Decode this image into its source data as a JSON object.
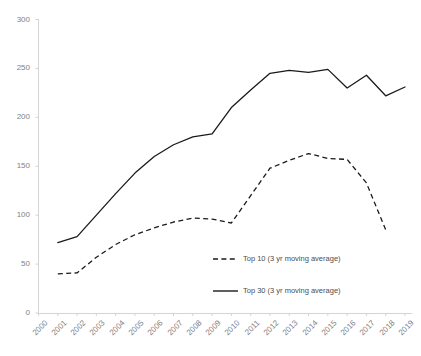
{
  "chart_data": {
    "type": "line",
    "title": "",
    "xlabel": "",
    "ylabel": "",
    "grid": false,
    "legend_position": "center-inside",
    "x": [
      2000,
      2001,
      2002,
      2003,
      2004,
      2005,
      2006,
      2007,
      2008,
      2009,
      2010,
      2011,
      2012,
      2013,
      2014,
      2015,
      2016,
      2017,
      2018,
      2019
    ],
    "xtick_labels": [
      "2000",
      "2001",
      "2002",
      "2003",
      "2004",
      "2005",
      "2006",
      "2007",
      "2008",
      "2009",
      "2010",
      "2011",
      "2012",
      "2013",
      "2014",
      "2015",
      "2016",
      "2017",
      "2018",
      "2019"
    ],
    "ytick_labels": [
      "0",
      "50",
      "100",
      "150",
      "200",
      "250",
      "300"
    ],
    "yticks": [
      0,
      50,
      100,
      150,
      200,
      250,
      300
    ],
    "ylim": [
      0,
      300
    ],
    "xlim": [
      2000,
      2019
    ],
    "series": [
      {
        "name": "Top 10 (3 yr moving average)",
        "style": "dashed",
        "color": "#1a1a1a",
        "x": [
          2001,
          2002,
          2003,
          2004,
          2005,
          2006,
          2007,
          2008,
          2009,
          2010,
          2011,
          2012,
          2013,
          2014,
          2015,
          2016,
          2017,
          2018
        ],
        "values": [
          40,
          41,
          57,
          70,
          80,
          87,
          93,
          97,
          96,
          92,
          120,
          148,
          156,
          163,
          158,
          157,
          133,
          85
        ]
      },
      {
        "name": "Top 30 (3 yr moving average)",
        "style": "solid",
        "color": "#1a1a1a",
        "x": [
          2001,
          2002,
          2003,
          2004,
          2005,
          2006,
          2007,
          2008,
          2009,
          2010,
          2011,
          2012,
          2013,
          2014,
          2015,
          2016,
          2017,
          2018,
          2019
        ],
        "values": [
          72,
          78,
          100,
          122,
          143,
          160,
          172,
          180,
          183,
          210,
          228,
          245,
          248,
          246,
          249,
          230,
          243,
          222,
          231
        ]
      }
    ]
  },
  "legend": {
    "items": [
      {
        "label": "Top 10 (3 yr moving average)",
        "style": "dashed"
      },
      {
        "label": "Top 30 (3 yr moving average)",
        "style": "solid"
      }
    ]
  },
  "axes": {
    "axis_color": "#d4d4d6",
    "tick_label_color": "#808285"
  }
}
